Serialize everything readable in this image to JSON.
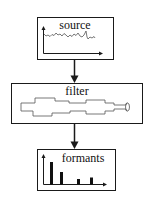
{
  "diagram": {
    "type": "flow",
    "direction": "top-to-bottom",
    "nodes": [
      {
        "id": "source",
        "label": "source",
        "icon": "waveform-plot-icon",
        "description": "time-domain noisy waveform with axes"
      },
      {
        "id": "filter",
        "label": "filter",
        "icon": "vocal-tract-tube-icon",
        "description": "stepped tube cross-section shape"
      },
      {
        "id": "formants",
        "label": "formants",
        "icon": "spectrum-bars-icon",
        "description": "bar spectrum with four peaks",
        "bars": [
          4,
          2.5,
          1,
          1.3
        ]
      }
    ],
    "edges": [
      {
        "from": "source",
        "to": "filter"
      },
      {
        "from": "filter",
        "to": "formants"
      }
    ],
    "colors": {
      "stroke": "#1a1a1a",
      "background": "#ffffff",
      "line_art": "#555555"
    }
  }
}
